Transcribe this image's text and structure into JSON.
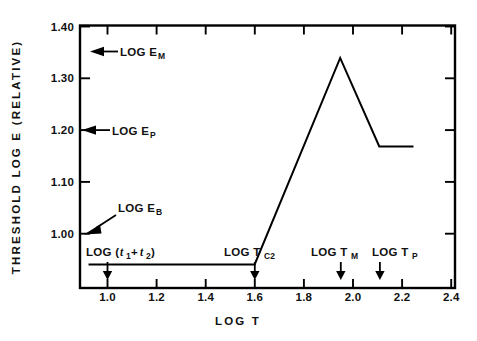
{
  "chart_data": {
    "type": "line",
    "title": "",
    "xlabel": "LOG T",
    "ylabel": "THRESHOLD  LOG  E   (RELATIVE)",
    "xlim": [
      0.885,
      2.42
    ],
    "ylim": [
      0.96,
      1.405
    ],
    "grid": false,
    "legend": "none",
    "xticks": [
      1.0,
      1.2,
      1.4,
      1.6,
      1.8,
      2.0,
      2.2,
      2.4
    ],
    "xtick_labels": [
      "1.0",
      "1.2",
      "1.4",
      "1.6",
      "1.8",
      "2.0",
      "2.2",
      "2.4"
    ],
    "yticks": [
      1.0,
      1.1,
      1.2,
      1.3,
      1.4
    ],
    "ytick_labels": [
      "1.00",
      "1.10",
      "1.20",
      "1.30",
      "1.40"
    ],
    "series": [
      {
        "name": "threshold curve",
        "x": [
          0.92,
          1.6,
          1.95,
          2.11,
          2.25
        ],
        "y": [
          1.0,
          1.0,
          1.35,
          1.2,
          1.2
        ]
      }
    ],
    "annotations": [
      {
        "id": "log-e-m",
        "text": "LOG E",
        "subscript": "M",
        "axis": "y",
        "value": 1.35,
        "arrow": "left"
      },
      {
        "id": "log-e-p",
        "text": "LOG E",
        "subscript": "P",
        "axis": "y",
        "value": 1.2,
        "arrow": "left"
      },
      {
        "id": "log-e-b",
        "text": "LOG E",
        "subscript": "B",
        "axis": "y",
        "value": 1.0,
        "arrow": "down-left"
      },
      {
        "id": "log-t1-t2",
        "text": "LOG (t",
        "subscript": "1",
        "text2": "+t",
        "subscript2": "2",
        "text3": ")",
        "axis": "x",
        "value": 1.0,
        "arrow": "down"
      },
      {
        "id": "log-t-c2",
        "text": "LOG T",
        "subscript": "C2",
        "axis": "x",
        "value": 1.6,
        "arrow": "down"
      },
      {
        "id": "log-t-m",
        "text": "LOG T",
        "subscript": "M",
        "axis": "x",
        "value": 1.95,
        "arrow": "down"
      },
      {
        "id": "log-t-p",
        "text": "LOG T",
        "subscript": "P",
        "axis": "x",
        "value": 2.11,
        "arrow": "down"
      }
    ]
  },
  "labels": {
    "y_axis_title": "THRESHOLD  LOG  E   (RELATIVE)",
    "x_axis_title": "LOG    T",
    "ytick_1_40": "1.40",
    "ytick_1_30": "1.30",
    "ytick_1_20": "1.20",
    "ytick_1_10": "1.10",
    "ytick_1_00": "1.00",
    "xtick_1_0": "1.0",
    "xtick_1_2": "1.2",
    "xtick_1_4": "1.4",
    "xtick_1_6": "1.6",
    "xtick_1_8": "1.8",
    "xtick_2_0": "2.0",
    "xtick_2_2": "2.2",
    "xtick_2_4": "2.4",
    "ann_em_main": "LOG E",
    "ann_em_sub": "M",
    "ann_ep_main": "LOG E",
    "ann_ep_sub": "P",
    "ann_eb_main": "LOG E",
    "ann_eb_sub": "B",
    "ann_t12_open": "LOG (",
    "ann_t12_t1": "t",
    "ann_t12_sub1": "1",
    "ann_t12_plus": "+",
    "ann_t12_t2": "t",
    "ann_t12_sub2": "2",
    "ann_t12_close": ")",
    "ann_tc2_main": "LOG T",
    "ann_tc2_sub": "C2",
    "ann_tm_main": "LOG T",
    "ann_tm_sub": "M",
    "ann_tp_main": "LOG T",
    "ann_tp_sub": "P"
  },
  "colors": {
    "ink": "#000000",
    "background": "#ffffff"
  }
}
